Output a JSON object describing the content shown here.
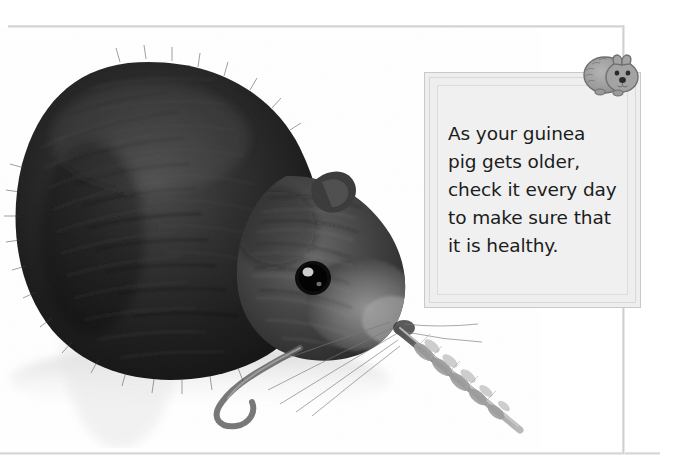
{
  "page": {
    "background_color": "#ffffff",
    "width": 673,
    "height": 474
  },
  "frame": {
    "line_color": "#cfcfcf",
    "top_rule_name": "top-horizontal-rule",
    "bottom_rule_name": "bottom-horizontal-rule",
    "right_rule_name": "right-vertical-rule"
  },
  "photo": {
    "subject": "guinea pig eating a stalk of grass",
    "style": "black-and-white photograph",
    "alt_text": "A dark grey guinea pig in profile chewing a long seed-head stalk of grass",
    "fur_color": "#2b2b2b",
    "background_color": "#ffffff"
  },
  "caption": {
    "text": "As your guinea\npig gets older,\ncheck it every day\nto make sure that\nit is healthy.",
    "lines": [
      "As your guinea",
      "pig gets older,",
      "check it every day",
      "to make sure that",
      "it is healthy."
    ],
    "text_color": "#1c1c1c",
    "box_fill": "#eeeeee",
    "box_border": "#c9c9c9"
  },
  "corner_icon": {
    "name": "guinea-pig-icon",
    "description": "cartoon grey guinea pig facing forward",
    "body_color": "#9a9a9a",
    "outline_color": "#6f6f6f",
    "nose_color": "#2a2a2a"
  }
}
